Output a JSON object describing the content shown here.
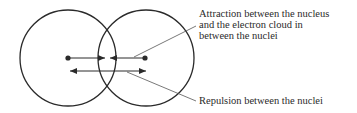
{
  "diagram": {
    "labels": {
      "attraction": {
        "lines": [
          "Attraction between the nucleus",
          "and the electron cloud in",
          "between the nuclei"
        ]
      },
      "repulsion": {
        "lines": [
          "Repulsion between the nuclei"
        ]
      }
    },
    "elements": {
      "atoms": [
        {
          "name": "left-atom",
          "nucleus": [
            68,
            58
          ],
          "radius": 48
        },
        {
          "name": "right-atom",
          "nucleus": [
            146,
            58
          ],
          "radius": 48
        }
      ],
      "arrows": {
        "attraction_left": {
          "from": [
            68,
            58
          ],
          "to": [
            104,
            58
          ]
        },
        "attraction_right": {
          "from": [
            146,
            58
          ],
          "to": [
            110,
            58
          ]
        },
        "repulsion": {
          "from": [
            70,
            71
          ],
          "to": [
            145,
            71
          ],
          "double_headed": true
        }
      }
    },
    "colors": {
      "stroke": "#2a2a2a",
      "leader": "#555555",
      "background": "#ffffff"
    }
  }
}
